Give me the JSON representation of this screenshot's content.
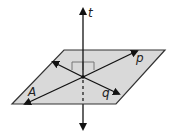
{
  "diagram": {
    "type": "geometry-plane-lines",
    "plane": {
      "label": "A",
      "fill": "#d9d9d9",
      "stroke": "#333333"
    },
    "lines": [
      {
        "label": "t",
        "orientation": "perpendicular to plane"
      },
      {
        "label": "p",
        "orientation": "in plane"
      },
      {
        "label": "q",
        "orientation": "in plane"
      }
    ],
    "annotations": [
      "right-angle marks at intersection"
    ]
  }
}
